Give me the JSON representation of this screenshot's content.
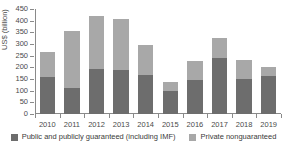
{
  "chart_data": {
    "type": "bar",
    "stacked": true,
    "title": "",
    "xlabel": "",
    "ylabel": "US$ (billion)",
    "ylim": [
      0,
      450
    ],
    "ytick_step": 50,
    "yticks": [
      0,
      50,
      100,
      150,
      200,
      250,
      300,
      350,
      400,
      450
    ],
    "grid": false,
    "legend_position": "bottom",
    "categories": [
      "2010",
      "2011",
      "2012",
      "2013",
      "2014",
      "2015",
      "2016",
      "2017",
      "2018",
      "2019"
    ],
    "series": [
      {
        "name": "Public and publicly guaranteed (including IMF)",
        "color": "#6d6d6d",
        "values": [
          160,
          110,
          193,
          187,
          166,
          97,
          146,
          239,
          150,
          165
        ]
      },
      {
        "name": "Private nonguaranteed",
        "color": "#a8a8a8",
        "values": [
          107,
          245,
          227,
          220,
          129,
          40,
          82,
          87,
          81,
          36
        ]
      }
    ],
    "totals": [
      267,
      355,
      420,
      407,
      295,
      137,
      228,
      326,
      231,
      201
    ]
  },
  "legend": {
    "items": [
      {
        "label": "Public and publicly guaranteed (including IMF)",
        "color": "#6d6d6d"
      },
      {
        "label": "Private nonguaranteed",
        "color": "#a8a8a8"
      }
    ]
  },
  "colors": {
    "ppg": "#6d6d6d",
    "png": "#a8a8a8",
    "axis": "#8a8a8a",
    "text": "#3a3a3a",
    "background": "#ffffff"
  }
}
